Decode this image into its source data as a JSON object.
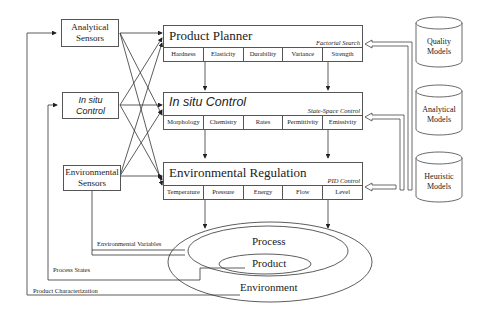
{
  "sensors": [
    {
      "label_line1": "Analytical",
      "label_line2": "Sensors"
    },
    {
      "label_line1": "In situ",
      "label_line2": "Control"
    },
    {
      "label_line1": "Environmental",
      "label_line2": "Sensors"
    }
  ],
  "controllers": [
    {
      "title": "Product Planner",
      "method": "Factorial Search",
      "cells": [
        "Hardness",
        "Elasticity",
        "Durability",
        "Variance",
        "Strength"
      ]
    },
    {
      "title": "In situ Control",
      "method": "State-Space Control",
      "cells": [
        "Morphology",
        "Chemistry",
        "Rates",
        "Permittivity",
        "Emissivity"
      ]
    },
    {
      "title": "Environmental Regulation",
      "method": "PID Control",
      "cells": [
        "Temperature",
        "Pressure",
        "Energy",
        "Flow",
        "Level"
      ]
    }
  ],
  "models": [
    {
      "label_line1": "Quality",
      "label_line2": "Models"
    },
    {
      "label_line1": "Analytical",
      "label_line2": "Models"
    },
    {
      "label_line1": "Heuristic",
      "label_line2": "Models"
    }
  ],
  "feedback": {
    "environmental_variables": "Environmental Variables",
    "process_states": "Process States",
    "product_characterization": "Product Characterization"
  },
  "system": {
    "process": "Process",
    "product": "Product",
    "environment": "Environment"
  }
}
